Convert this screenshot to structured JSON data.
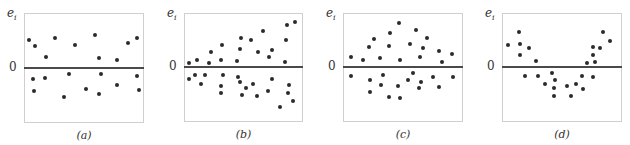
{
  "chart_data": [
    {
      "type": "scatter",
      "title": "",
      "panel_label": "(a)",
      "ylabel": "e_i",
      "xlabel": "",
      "zero_label": "0",
      "box": {
        "left": 24,
        "top": 13,
        "right": 144,
        "bottom": 123,
        "zero_y": 68
      },
      "points_px": [
        [
          29,
          40
        ],
        [
          35,
          46
        ],
        [
          46,
          57
        ],
        [
          55,
          38
        ],
        [
          75,
          45
        ],
        [
          95,
          35
        ],
        [
          99,
          58
        ],
        [
          117,
          60
        ],
        [
          128,
          43
        ],
        [
          137,
          38
        ],
        [
          33,
          79
        ],
        [
          34,
          91
        ],
        [
          45,
          78
        ],
        [
          64,
          97
        ],
        [
          69,
          74
        ],
        [
          86,
          89
        ],
        [
          99,
          94
        ],
        [
          101,
          74
        ],
        [
          117,
          85
        ],
        [
          137,
          76
        ],
        [
          139,
          90
        ]
      ],
      "pattern": "random scatter around zero (constant variance)"
    },
    {
      "type": "scatter",
      "title": "",
      "panel_label": "(b)",
      "ylabel": "e_i",
      "xlabel": "",
      "zero_label": "0",
      "box": {
        "left": 184,
        "top": 13,
        "right": 303,
        "bottom": 122,
        "zero_y": 67
      },
      "points_px": [
        [
          189,
          63
        ],
        [
          197,
          60
        ],
        [
          211,
          52
        ],
        [
          209,
          63
        ],
        [
          222,
          45
        ],
        [
          221,
          60
        ],
        [
          241,
          38
        ],
        [
          240,
          49
        ],
        [
          237,
          61
        ],
        [
          251,
          40
        ],
        [
          258,
          52
        ],
        [
          263,
          31
        ],
        [
          269,
          57
        ],
        [
          272,
          50
        ],
        [
          287,
          25
        ],
        [
          295,
          22
        ],
        [
          286,
          40
        ],
        [
          285,
          62
        ],
        [
          189,
          79
        ],
        [
          195,
          75
        ],
        [
          201,
          84
        ],
        [
          205,
          75
        ],
        [
          221,
          86
        ],
        [
          221,
          93
        ],
        [
          223,
          75
        ],
        [
          238,
          77
        ],
        [
          240,
          82
        ],
        [
          246,
          88
        ],
        [
          242,
          95
        ],
        [
          253,
          84
        ],
        [
          257,
          96
        ],
        [
          268,
          91
        ],
        [
          272,
          79
        ],
        [
          280,
          107
        ],
        [
          289,
          85
        ],
        [
          288,
          93
        ],
        [
          293,
          101
        ]
      ],
      "pattern": "funnel shape — spread increases with x"
    },
    {
      "type": "scatter",
      "title": "",
      "panel_label": "(c)",
      "ylabel": "e_i",
      "xlabel": "",
      "zero_label": "0",
      "box": {
        "left": 343,
        "top": 13,
        "right": 463,
        "bottom": 122,
        "zero_y": 67
      },
      "points_px": [
        [
          351,
          57
        ],
        [
          363,
          60
        ],
        [
          369,
          47
        ],
        [
          374,
          39
        ],
        [
          380,
          58
        ],
        [
          389,
          46
        ],
        [
          390,
          33
        ],
        [
          399,
          23
        ],
        [
          400,
          60
        ],
        [
          410,
          44
        ],
        [
          416,
          30
        ],
        [
          420,
          57
        ],
        [
          423,
          48
        ],
        [
          427,
          38
        ],
        [
          439,
          51
        ],
        [
          442,
          62
        ],
        [
          452,
          54
        ],
        [
          351,
          76
        ],
        [
          370,
          80
        ],
        [
          370,
          92
        ],
        [
          381,
          85
        ],
        [
          383,
          75
        ],
        [
          389,
          97
        ],
        [
          398,
          86
        ],
        [
          400,
          98
        ],
        [
          408,
          80
        ],
        [
          413,
          73
        ],
        [
          419,
          88
        ],
        [
          421,
          82
        ],
        [
          433,
          77
        ],
        [
          439,
          87
        ],
        [
          453,
          77
        ]
      ],
      "pattern": "diamond / bulge — spread largest in the middle"
    },
    {
      "type": "scatter",
      "title": "",
      "panel_label": "(d)",
      "ylabel": "e_i",
      "xlabel": "",
      "zero_label": "0",
      "box": {
        "left": 502,
        "top": 13,
        "right": 622,
        "bottom": 122,
        "zero_y": 67
      },
      "points_px": [
        [
          508,
          45
        ],
        [
          519,
          32
        ],
        [
          520,
          44
        ],
        [
          520,
          55
        ],
        [
          529,
          48
        ],
        [
          536,
          61
        ],
        [
          587,
          63
        ],
        [
          593,
          47
        ],
        [
          593,
          55
        ],
        [
          595,
          62
        ],
        [
          600,
          48
        ],
        [
          603,
          32
        ],
        [
          610,
          41
        ],
        [
          525,
          76
        ],
        [
          538,
          76
        ],
        [
          545,
          84
        ],
        [
          552,
          73
        ],
        [
          555,
          80
        ],
        [
          554,
          88
        ],
        [
          554,
          96
        ],
        [
          567,
          86
        ],
        [
          571,
          96
        ],
        [
          576,
          84
        ],
        [
          582,
          76
        ],
        [
          583,
          89
        ],
        [
          593,
          77
        ]
      ],
      "pattern": "U-shaped curvature (nonlinearity)"
    }
  ],
  "labels": {
    "ylabel_base": "e",
    "ylabel_sub": "i",
    "zero": "0",
    "panels": [
      "(a)",
      "(b)",
      "(c)",
      "(d)"
    ]
  }
}
